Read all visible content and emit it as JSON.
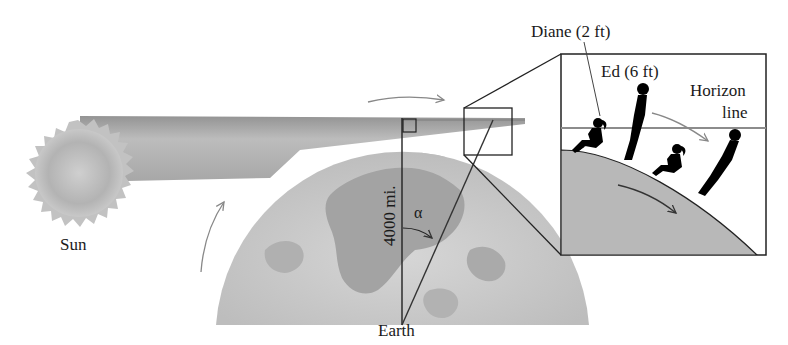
{
  "figure": {
    "labels": {
      "sun": "Sun",
      "earth": "Earth",
      "radius": "4000 mi.",
      "angle": "α",
      "diane": "Diane (2 ft)",
      "ed": "Ed (6 ft)",
      "horizon_line_1": "Horizon",
      "horizon_line_2": "line"
    },
    "colors": {
      "background": "#ffffff",
      "sun": "#b5b5b5",
      "beam": "#a9a9a9",
      "earth": "#c4c4c4",
      "earth_land": "#9a9a9a",
      "horizon_line": "#8c8c8c",
      "outline": "#222222",
      "silhouette": "#000000",
      "inset_ground": "#b8b8b8"
    },
    "elements": {
      "inset": {
        "description": "Magnified view of observers on Earth's curved surface"
      },
      "rotation_arrows": 3
    }
  }
}
